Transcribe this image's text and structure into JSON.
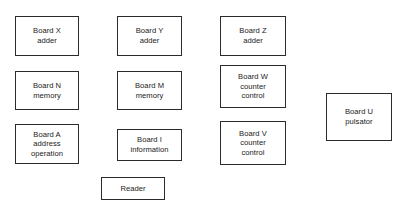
{
  "diagram": {
    "canvas": {
      "width": 403,
      "height": 211,
      "background": "#ffffff"
    },
    "style": {
      "box_border_color": "#2b2b2b",
      "box_fill": "#ffffff",
      "text_color": "#1a1a1a"
    },
    "boxes": [
      {
        "id": "board-x",
        "name": "board-x-adder",
        "lines": [
          "Board X",
          "adder"
        ],
        "x": 15,
        "y": 16,
        "w": 64,
        "h": 40
      },
      {
        "id": "board-y",
        "name": "board-y-adder",
        "lines": [
          "Board Y",
          "adder"
        ],
        "x": 117,
        "y": 16,
        "w": 65,
        "h": 40
      },
      {
        "id": "board-z",
        "name": "board-z-adder",
        "lines": [
          "Board Z",
          "adder"
        ],
        "x": 220,
        "y": 16,
        "w": 66,
        "h": 40
      },
      {
        "id": "board-n",
        "name": "board-n-memory",
        "lines": [
          "Board N",
          "memory"
        ],
        "x": 15,
        "y": 71,
        "w": 64,
        "h": 39
      },
      {
        "id": "board-m",
        "name": "board-m-memory",
        "lines": [
          "Board M",
          "memory"
        ],
        "x": 117,
        "y": 71,
        "w": 65,
        "h": 39
      },
      {
        "id": "board-w",
        "name": "board-w-counter-control",
        "lines": [
          "Board W",
          "counter",
          "control"
        ],
        "x": 220,
        "y": 65,
        "w": 66,
        "h": 43
      },
      {
        "id": "board-u",
        "name": "board-u-pulsator",
        "lines": [
          "Board U",
          "pulsator"
        ],
        "x": 326,
        "y": 93,
        "w": 66,
        "h": 48
      },
      {
        "id": "board-a",
        "name": "board-a-address-operation",
        "lines": [
          "Board A",
          "address",
          "operation"
        ],
        "x": 15,
        "y": 124,
        "w": 64,
        "h": 40
      },
      {
        "id": "board-i",
        "name": "board-i-information",
        "lines": [
          "Board I",
          "information"
        ],
        "x": 117,
        "y": 129,
        "w": 65,
        "h": 32
      },
      {
        "id": "board-v",
        "name": "board-v-counter-control",
        "lines": [
          "Board V",
          "counter",
          "control"
        ],
        "x": 220,
        "y": 121,
        "w": 66,
        "h": 44
      },
      {
        "id": "reader",
        "name": "reader",
        "lines": [
          "Reader"
        ],
        "x": 101,
        "y": 177,
        "w": 64,
        "h": 23
      }
    ]
  }
}
